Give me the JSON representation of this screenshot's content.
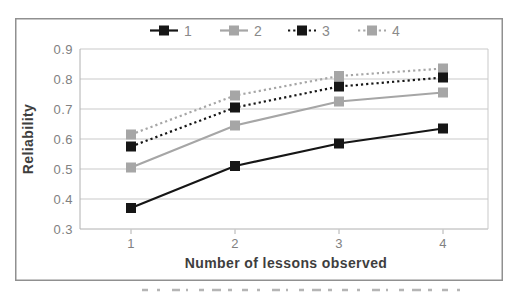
{
  "chart_data": {
    "type": "line",
    "title": "",
    "xlabel": "Number of lessons observed",
    "ylabel": "Reliability",
    "x_tick_labels": [
      "1",
      "2",
      "3",
      "4"
    ],
    "y_tick_labels": [
      "0.9",
      "0.8",
      "0.7",
      "0.6",
      "0.5",
      "0.4",
      "0.3"
    ],
    "ylim": [
      0.3,
      0.9
    ],
    "grid": true,
    "legend_position": "top",
    "series": [
      {
        "name": "1",
        "color": "#161616",
        "line_style": "solid",
        "values": [
          0.37,
          0.51,
          0.585,
          0.635
        ]
      },
      {
        "name": "2",
        "color": "#a6a6a6",
        "line_style": "solid",
        "values": [
          0.505,
          0.645,
          0.725,
          0.755
        ]
      },
      {
        "name": "3",
        "color": "#161616",
        "line_style": "dotted",
        "values": [
          0.575,
          0.705,
          0.775,
          0.805
        ]
      },
      {
        "name": "4",
        "color": "#a6a6a6",
        "line_style": "dotted",
        "values": [
          0.615,
          0.745,
          0.81,
          0.835
        ]
      }
    ],
    "colors": {
      "grid_line": "#c9c9c9",
      "axis_line": "#b0b0b0",
      "frame_border": "#909090",
      "tick_text": "#818181",
      "axis_title_text": "#3e3e3e",
      "caption_fragment": "#b5b5b5"
    }
  }
}
